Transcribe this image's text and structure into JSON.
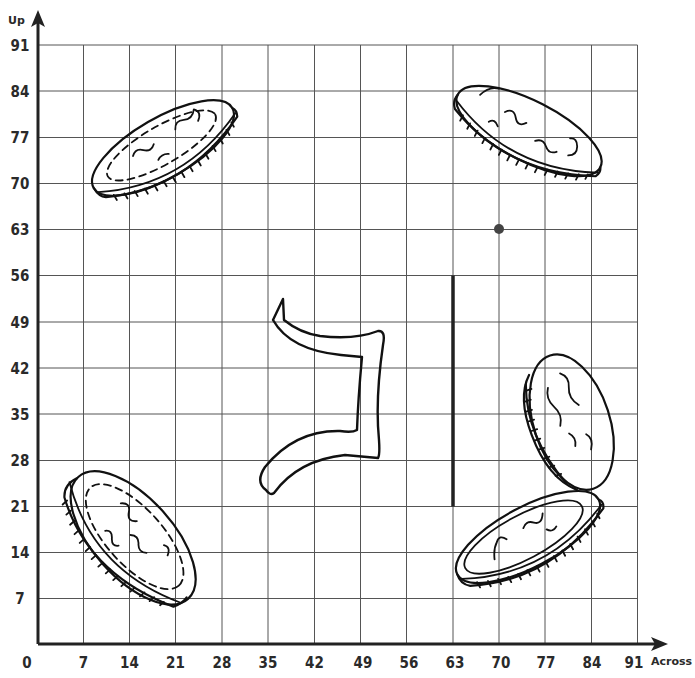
{
  "graph": {
    "x_axis_title": "Across",
    "y_axis_title": "Up",
    "x_ticks": [
      "0",
      "7",
      "14",
      "21",
      "28",
      "35",
      "42",
      "49",
      "56",
      "63",
      "70",
      "77",
      "84",
      "91"
    ],
    "y_ticks": [
      "91",
      "84",
      "77",
      "70",
      "63",
      "56",
      "49",
      "42",
      "35",
      "28",
      "21",
      "14",
      "7"
    ],
    "grid_step": 7,
    "grid_max": 91,
    "colors": {
      "axis": "#222222",
      "grid": "#555555",
      "ink": "#111111",
      "point": "#444444"
    }
  },
  "objects": {
    "coin_top_left": {
      "label": "coin",
      "orientation": "tilted up-right",
      "approx_center": [
        16,
        77
      ]
    },
    "coin_top_right": {
      "label": "coin",
      "orientation": "tilted down-right",
      "approx_center": [
        74,
        77
      ]
    },
    "coin_bottom_left": {
      "label": "coin",
      "orientation": "tilted down-right",
      "approx_center": [
        14,
        16
      ]
    },
    "coin_bottom_right_upright": {
      "label": "coin",
      "orientation": "standing on edge",
      "approx_center": [
        80,
        35
      ]
    },
    "coin_bottom_right_flat": {
      "label": "coin",
      "orientation": "tilted up-right",
      "approx_center": [
        74,
        17
      ]
    },
    "shape": {
      "label": "reversed Z-like shape",
      "approx_bbox": [
        35,
        23,
        53,
        52
      ]
    },
    "vertical_line": {
      "x": 63,
      "y_from": 21,
      "y_to": 56
    },
    "point": {
      "x": 70,
      "y": 63
    }
  }
}
